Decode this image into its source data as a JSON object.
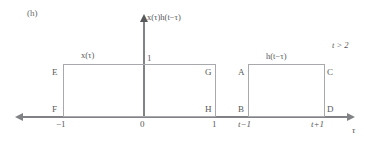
{
  "figure": {
    "panel_label": "(h)",
    "condition": "t > 2",
    "y_axis_label": "x(τ)h(t−τ)",
    "x_axis_label": "τ",
    "y_tick": "1",
    "captions": {
      "left_pulse": "x(τ)",
      "right_pulse": "h(t−τ)"
    },
    "x_ticks": {
      "neg_one": "−1",
      "zero": "0",
      "one": "1",
      "t_minus_one": "t−1",
      "t_plus_one": "t+1"
    },
    "vertices": {
      "E": "E",
      "F": "F",
      "G": "G",
      "H": "H",
      "A": "A",
      "B": "B",
      "C": "C",
      "D": "D"
    },
    "colors": {
      "axis": "#808285",
      "pulse_outline": "#a7a9ac",
      "text": "#58595b"
    }
  }
}
